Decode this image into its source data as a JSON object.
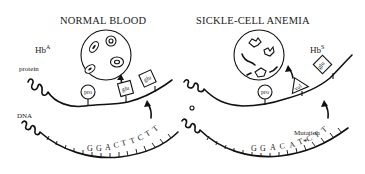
{
  "panels": [
    {
      "id": "normal",
      "title": "NORMAL BLOOD",
      "hemoglobin": {
        "base": "Hb",
        "sup": "A"
      },
      "protein_label": "protein",
      "dna_label": "DNA",
      "amino_acids": [
        "pro",
        "glu",
        "glu"
      ],
      "dna_sequence": [
        "G",
        "G",
        "A",
        "C",
        "T",
        "T",
        "C",
        "T",
        "T"
      ],
      "cell_type": "normal red blood cells"
    },
    {
      "id": "sickle",
      "title": "SICKLE-CELL ANEMIA",
      "hemoglobin": {
        "base": "Hb",
        "sup": "S"
      },
      "mutation_label": "Mutation",
      "mutation_marker": "*",
      "amino_acids": [
        "pro",
        "val",
        "glu"
      ],
      "dna_sequence": [
        "G",
        "G",
        "A",
        "C",
        "A",
        "T",
        "C",
        "T",
        "T"
      ],
      "cell_type": "sickled red blood cells"
    }
  ]
}
